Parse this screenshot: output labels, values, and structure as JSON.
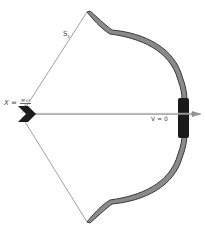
{
  "diagram": {
    "labels": {
      "x_symbol": "X",
      "x_equals": "=",
      "x_fraction_numerator": "M·v²",
      "x_fraction_denominator": "k",
      "string_symbol": "S",
      "string_subscript": "1",
      "velocity_label": "V = 0"
    },
    "colors": {
      "limb_fill": "#8a8a8a",
      "limb_outline": "#3a3a3a",
      "grip": "#1a1a1a",
      "string": "#777777",
      "arrow_shaft": "#999999",
      "fletching": "#1c1c1c",
      "background": "#ffffff"
    }
  }
}
